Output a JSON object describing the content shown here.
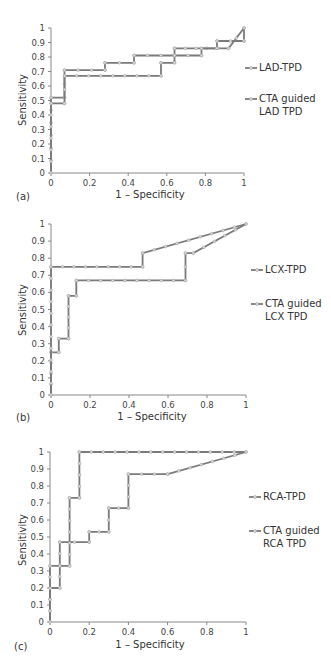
{
  "colors": {
    "series_line": "#7a7a7a",
    "marker_fill": "#d9d9d9",
    "axis": "#888888",
    "text": "#333333"
  },
  "chart_data": [
    {
      "type": "line",
      "panel": "(a)",
      "title": "",
      "xlabel": "1 – Specificity",
      "ylabel": "Sensitivity",
      "xlim": [
        0,
        1
      ],
      "ylim": [
        0,
        1
      ],
      "x_ticks": [
        "0",
        "0.2",
        "0.4",
        "0.6",
        "0.8",
        "1"
      ],
      "y_ticks": [
        "0",
        "0.1",
        "0.2",
        "0.3",
        "0.4",
        "0.5",
        "0.6",
        "0.7",
        "0.8",
        "0.9",
        "1"
      ],
      "grid": false,
      "legend_position": "right",
      "series": [
        {
          "name": "LAD-TPD",
          "points": [
            [
              0,
              0
            ],
            [
              0,
              0.52
            ],
            [
              0.07,
              0.52
            ],
            [
              0.07,
              0.71
            ],
            [
              0.28,
              0.71
            ],
            [
              0.28,
              0.76
            ],
            [
              0.43,
              0.76
            ],
            [
              0.43,
              0.81
            ],
            [
              0.64,
              0.81
            ],
            [
              0.64,
              0.86
            ],
            [
              0.92,
              0.86
            ],
            [
              1,
              1
            ]
          ]
        },
        {
          "name": "CTA guided LAD TPD",
          "points": [
            [
              0,
              0
            ],
            [
              0,
              0.48
            ],
            [
              0.07,
              0.48
            ],
            [
              0.07,
              0.67
            ],
            [
              0.57,
              0.67
            ],
            [
              0.57,
              0.76
            ],
            [
              0.64,
              0.76
            ],
            [
              0.64,
              0.81
            ],
            [
              0.78,
              0.81
            ],
            [
              0.78,
              0.86
            ],
            [
              0.86,
              0.86
            ],
            [
              0.86,
              0.91
            ],
            [
              1,
              0.91
            ],
            [
              1,
              1
            ]
          ]
        }
      ]
    },
    {
      "type": "line",
      "panel": "(b)",
      "title": "",
      "xlabel": "1 – Specificity",
      "ylabel": "Sensitivity",
      "xlim": [
        0,
        1
      ],
      "ylim": [
        0,
        1
      ],
      "x_ticks": [
        "0",
        "0.2",
        "0.4",
        "0.6",
        "0.8",
        "1"
      ],
      "y_ticks": [
        "0",
        "0.1",
        "0.2",
        "0.3",
        "0.4",
        "0.5",
        "0.6",
        "0.7",
        "0.8",
        "0.9",
        "1"
      ],
      "grid": false,
      "legend_position": "right",
      "series": [
        {
          "name": "LCX-TPD",
          "points": [
            [
              0,
              0
            ],
            [
              0,
              0.25
            ],
            [
              0.04,
              0.25
            ],
            [
              0.04,
              0.33
            ],
            [
              0.09,
              0.33
            ],
            [
              0.09,
              0.58
            ],
            [
              0.13,
              0.58
            ],
            [
              0.13,
              0.67
            ],
            [
              0.69,
              0.67
            ],
            [
              0.69,
              0.83
            ],
            [
              0.73,
              0.83
            ],
            [
              1,
              1
            ]
          ]
        },
        {
          "name": "CTA guided LCX TPD",
          "points": [
            [
              0,
              0
            ],
            [
              0,
              0.75
            ],
            [
              0.47,
              0.75
            ],
            [
              0.47,
              0.83
            ],
            [
              1,
              1
            ]
          ]
        }
      ]
    },
    {
      "type": "line",
      "panel": "(c)",
      "title": "",
      "xlabel": "1 – Specificity",
      "ylabel": "Sensitivity",
      "xlim": [
        0,
        1
      ],
      "ylim": [
        0,
        1
      ],
      "x_ticks": [
        "0",
        "0.2",
        "0.4",
        "0.6",
        "0.8",
        "1"
      ],
      "y_ticks": [
        "0",
        "0.1",
        "0.2",
        "0.3",
        "0.4",
        "0.5",
        "0.6",
        "0.7",
        "0.8",
        "0.9",
        "1"
      ],
      "grid": false,
      "legend_position": "right",
      "series": [
        {
          "name": "RCA-TPD",
          "points": [
            [
              0,
              0
            ],
            [
              0,
              0.2
            ],
            [
              0.05,
              0.2
            ],
            [
              0.05,
              0.47
            ],
            [
              0.2,
              0.47
            ],
            [
              0.2,
              0.53
            ],
            [
              0.3,
              0.53
            ],
            [
              0.3,
              0.67
            ],
            [
              0.4,
              0.67
            ],
            [
              0.4,
              0.87
            ],
            [
              0.6,
              0.87
            ],
            [
              1,
              1
            ]
          ]
        },
        {
          "name": "CTA guided RCA TPD",
          "points": [
            [
              0,
              0
            ],
            [
              0,
              0.33
            ],
            [
              0.1,
              0.33
            ],
            [
              0.1,
              0.73
            ],
            [
              0.15,
              0.73
            ],
            [
              0.15,
              1
            ],
            [
              1,
              1
            ]
          ]
        }
      ]
    }
  ],
  "panels": [
    {
      "tag": "(a)",
      "xlabel": "1 – Specificity",
      "ylabel": "Sensitivity",
      "legend": [
        {
          "line1": "LAD-TPD",
          "line2": ""
        },
        {
          "line1": "CTA guided",
          "line2": "LAD TPD"
        }
      ]
    },
    {
      "tag": "(b)",
      "xlabel": "1 – Specificity",
      "ylabel": "Sensitivity",
      "legend": [
        {
          "line1": "LCX-TPD",
          "line2": ""
        },
        {
          "line1": "CTA guided",
          "line2": "LCX TPD"
        }
      ]
    },
    {
      "tag": "(c)",
      "xlabel": "1 – Specificity",
      "ylabel": "Sensitivity",
      "legend": [
        {
          "line1": "RCA-TPD",
          "line2": ""
        },
        {
          "line1": "CTA guided",
          "line2": "RCA TPD"
        }
      ]
    }
  ]
}
